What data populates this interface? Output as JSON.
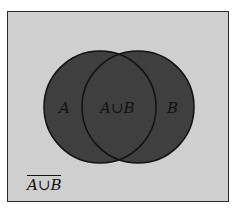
{
  "diagram": {
    "type": "venn",
    "colors": {
      "page_background": "#ffffff",
      "universe_fill": "#cfcfcf",
      "set_fill": "#3f3f3f",
      "outline": "#111111"
    },
    "sets": [
      {
        "id": "A",
        "label": "A"
      },
      {
        "id": "B",
        "label": "B"
      }
    ],
    "intersection_label": "A∪B",
    "complement_label": "A∪B",
    "complement_overlined": true
  }
}
